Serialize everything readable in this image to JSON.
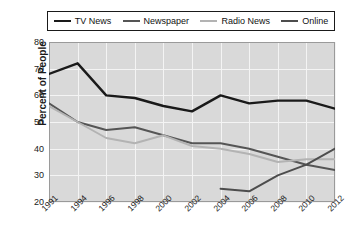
{
  "chart_data": {
    "type": "line",
    "title": "",
    "xlabel": "",
    "ylabel": "Percent of People",
    "x": [
      1991,
      1994,
      1996,
      1998,
      2000,
      2002,
      2004,
      2006,
      2008,
      2010,
      2012
    ],
    "xtick_labels": [
      "1991",
      "1994",
      "1996",
      "1998",
      "2000",
      "2002",
      "2004",
      "2006",
      "2008",
      "2010",
      "2012"
    ],
    "ylim": [
      20,
      80
    ],
    "yticks": [
      20,
      30,
      40,
      50,
      60,
      70,
      80
    ],
    "ytick_labels": [
      "20",
      "30",
      "40",
      "50",
      "60",
      "70",
      "80"
    ],
    "grid": true,
    "legend_position": "top",
    "series": [
      {
        "name": "TV News",
        "color": "#1a1a1a",
        "width": 2.4,
        "x": [
          1991,
          1994,
          1996,
          1998,
          2000,
          2002,
          2004,
          2006,
          2008,
          2010,
          2012
        ],
        "values": [
          68,
          72,
          60,
          59,
          56,
          54,
          60,
          57,
          58,
          58,
          55
        ]
      },
      {
        "name": "Newspaper",
        "color": "#555555",
        "width": 2.0,
        "x": [
          1991,
          1994,
          1996,
          1998,
          2000,
          2002,
          2004,
          2006,
          2008,
          2010,
          2012
        ],
        "values": [
          57,
          50,
          47,
          48,
          45,
          42,
          42,
          40,
          37,
          34,
          32
        ]
      },
      {
        "name": "Radio News",
        "color": "#b3b3b3",
        "width": 2.0,
        "x": [
          1991,
          1994,
          1996,
          1998,
          2000,
          2002,
          2004,
          2006,
          2008,
          2010,
          2012
        ],
        "values": [
          56,
          50,
          44,
          42,
          45,
          41,
          40,
          38,
          35,
          36,
          36
        ]
      },
      {
        "name": "Online",
        "color": "#4d4d4d",
        "width": 2.0,
        "x": [
          2004,
          2006,
          2008,
          2010,
          2012
        ],
        "values": [
          25,
          24,
          30,
          34,
          40
        ]
      }
    ]
  }
}
